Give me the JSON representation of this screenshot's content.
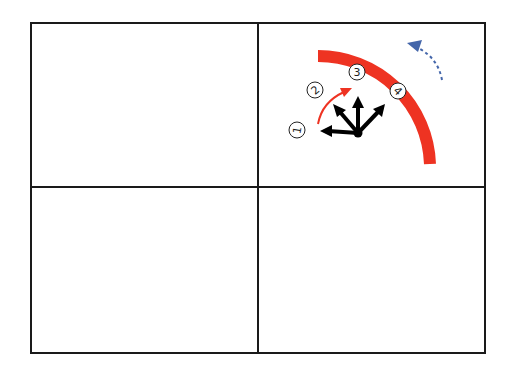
{
  "diagram": {
    "grid": {
      "rows": 2,
      "cols": 2,
      "line_color": "#1a1a1a"
    },
    "panels": [
      {
        "position": "top-left",
        "content": "empty"
      },
      {
        "position": "top-right",
        "content": "rotation-illustration"
      },
      {
        "position": "bottom-left",
        "content": "empty"
      },
      {
        "position": "bottom-right",
        "content": "empty"
      }
    ],
    "illustration": {
      "step_labels": [
        "1",
        "2",
        "3",
        "4"
      ],
      "arc_color": "#ee3322",
      "small_arrow_color": "#ee3322",
      "dashed_arrow_color": "#4466aa",
      "arrow_color": "#000000"
    }
  }
}
